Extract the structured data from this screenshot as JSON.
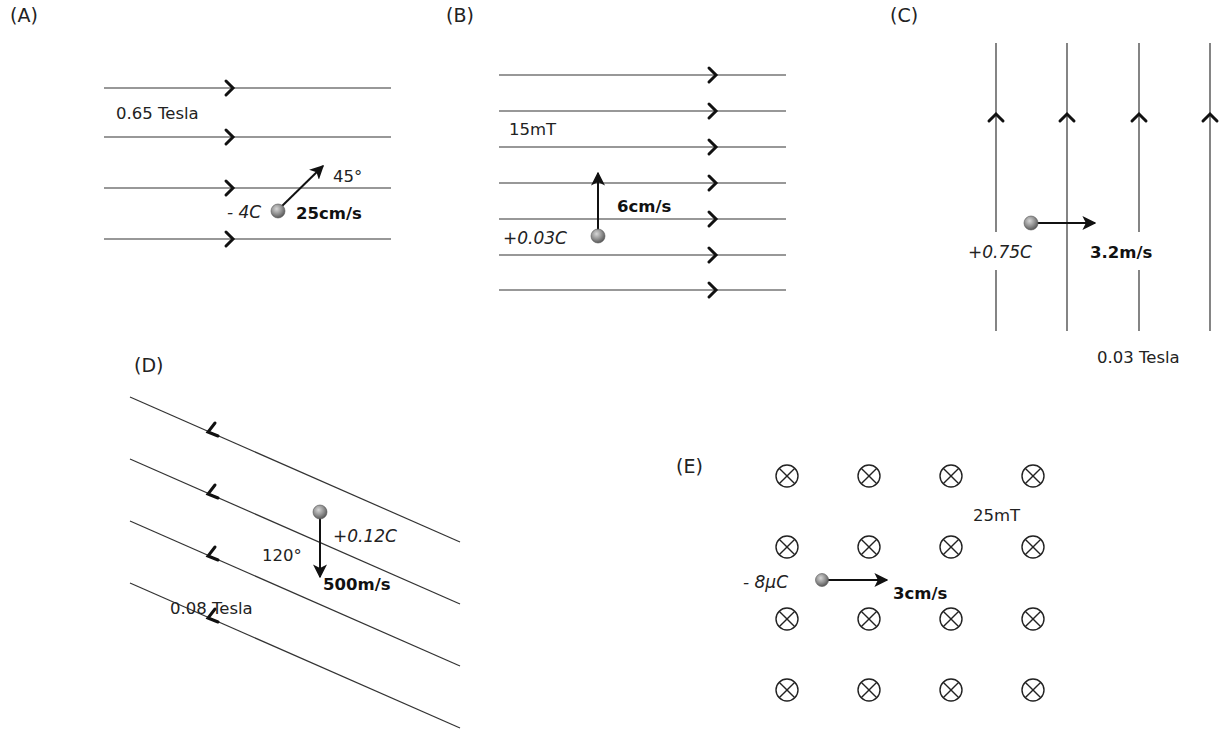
{
  "figure": {
    "background": "#ffffff",
    "panels": [
      {
        "id": "A",
        "label": "(A)",
        "field": "0.65 Tesla",
        "field_direction": "right",
        "charge": "- 4C",
        "velocity": "25cm/s",
        "angle": "45°",
        "velocity_direction": "45° up-right"
      },
      {
        "id": "B",
        "label": "(B)",
        "field": "15mT",
        "field_direction": "right",
        "charge": "+0.03C",
        "velocity": "6cm/s",
        "velocity_direction": "up"
      },
      {
        "id": "C",
        "label": "(C)",
        "field": "0.03 Tesla",
        "field_direction": "up",
        "charge": "+0.75C",
        "velocity": "3.2m/s",
        "velocity_direction": "right"
      },
      {
        "id": "D",
        "label": "(D)",
        "field": "0.08 Tesla",
        "field_direction": "up-left (diagonal)",
        "charge": "+0.12C",
        "velocity": "500m/s",
        "angle": "120°",
        "velocity_direction": "down"
      },
      {
        "id": "E",
        "label": "(E)",
        "field": "25mT",
        "field_direction": "into page",
        "field_symbol": "⊗",
        "charge": "- 8μC",
        "velocity": "3cm/s",
        "velocity_direction": "right"
      }
    ]
  },
  "colors": {
    "line": "#333333",
    "arrow": "#111111",
    "particle_fill": "#8a8a8a",
    "particle_highlight": "#cfcfcf",
    "text": "#222222"
  }
}
